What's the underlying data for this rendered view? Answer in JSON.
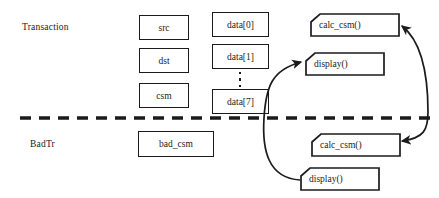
{
  "diagram": {
    "lanes": [
      {
        "name": "transaction-lane",
        "label": "Transaction",
        "x": 22,
        "y": 22
      },
      {
        "name": "badtr-lane",
        "label": "BadTr",
        "x": 30,
        "y": 139
      }
    ],
    "divider": {
      "name": "lane-divider",
      "style": "dashed",
      "x1": 20,
      "y1": 118,
      "x2": 430,
      "y2": 118,
      "color": "#1b1b1b",
      "stroke_width": 3.4,
      "dash": "11 8"
    },
    "field_boxes": [
      {
        "name": "field-box-src",
        "label": "src",
        "x": 139,
        "y": 15,
        "w": 50,
        "h": 25
      },
      {
        "name": "field-box-dst",
        "label": "dst",
        "x": 139,
        "y": 48,
        "w": 50,
        "h": 25
      },
      {
        "name": "field-box-csm",
        "label": "csm",
        "x": 139,
        "y": 83,
        "w": 50,
        "h": 25
      },
      {
        "name": "field-box-data0",
        "label": "data[0]",
        "x": 212,
        "y": 12,
        "w": 57,
        "h": 25
      },
      {
        "name": "field-box-data1",
        "label": "data[1]",
        "x": 212,
        "y": 44,
        "w": 57,
        "h": 25
      },
      {
        "name": "field-box-data7",
        "label": "data[7]",
        "x": 212,
        "y": 89,
        "w": 57,
        "h": 25
      },
      {
        "name": "field-box-bad-csm",
        "label": "bad_csm",
        "x": 138,
        "y": 131,
        "w": 76,
        "h": 26
      }
    ],
    "ellipsis": {
      "name": "data-array-ellipsis",
      "x": 238,
      "y": 72,
      "w": 4,
      "h": 15,
      "dots": 3
    },
    "method_boxes": [
      {
        "name": "method-box-calc-csm-transaction",
        "label": "calc_csm()",
        "x": 310,
        "y": 13,
        "w": 90,
        "h": 24,
        "notch": 9
      },
      {
        "name": "method-box-display-transaction",
        "label": "display()",
        "x": 305,
        "y": 52,
        "w": 80,
        "h": 24,
        "notch": 9
      },
      {
        "name": "method-box-calc-csm-badtr",
        "label": "calc_csm()",
        "x": 311,
        "y": 133,
        "w": 90,
        "h": 24,
        "notch": 9
      },
      {
        "name": "method-box-display-badtr",
        "label": "display()",
        "x": 300,
        "y": 167,
        "w": 80,
        "h": 24,
        "notch": 9
      }
    ],
    "connectors": [
      {
        "name": "connector-display-badtr-to-display-transaction",
        "path": "M 300 180 C 268 178 262 150 264 118 C 266 86 272 70 301 62",
        "arrow_start": false,
        "arrow_end": true
      },
      {
        "name": "connector-calc-csm-bidirectional",
        "path": "M 402 141 C 424 138 428 130 428 112 C 428 70 420 40 402 26",
        "arrow_start": true,
        "arrow_end": true
      }
    ],
    "colors": {
      "stroke": "#1b1b1b",
      "background": "#ffffff"
    }
  }
}
